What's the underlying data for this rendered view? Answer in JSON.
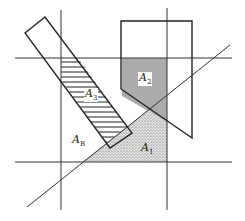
{
  "diagram": {
    "labels": {
      "a1": {
        "main": "A",
        "sub": "1"
      },
      "a2": {
        "main": "A",
        "sub": "2"
      },
      "a3": {
        "main": "A",
        "sub": "3"
      },
      "ab": {
        "main": "A",
        "sub": "B"
      }
    },
    "colors": {
      "line": "#222222",
      "a2_fill": "#a8a8a8",
      "a1_fill": "#d8d8d8"
    }
  }
}
